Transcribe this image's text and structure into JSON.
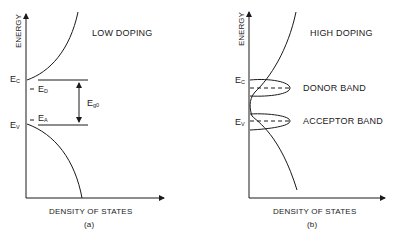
{
  "panels": [
    {
      "id": "a",
      "title": "LOW DOPING",
      "y_axis_label": "ENERGY",
      "x_axis_label": "DENSITY OF STATES",
      "caption": "(a)",
      "levels": {
        "conduction": {
          "main": "E",
          "sub": "C"
        },
        "donor": {
          "main": "E",
          "sub": "D"
        },
        "acceptor": {
          "main": "E",
          "sub": "A"
        },
        "valence": {
          "main": "E",
          "sub": "V"
        },
        "gap": {
          "main": "E",
          "sub": "g0"
        }
      }
    },
    {
      "id": "b",
      "title": "HIGH DOPING",
      "y_axis_label": "ENERGY",
      "x_axis_label": "DENSITY OF STATES",
      "caption": "(b)",
      "levels": {
        "conduction": {
          "main": "E",
          "sub": "C"
        },
        "valence": {
          "main": "E",
          "sub": "V"
        }
      },
      "bands": [
        "DONOR BAND",
        "ACCEPTOR BAND"
      ]
    }
  ]
}
